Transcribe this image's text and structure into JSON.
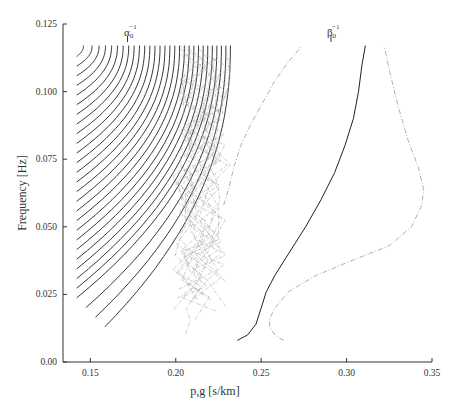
{
  "chart_data": {
    "type": "line",
    "title": "",
    "xlabel": "p,g [s/km]",
    "ylabel": "Frequency [Hz]",
    "xlim": [
      0.134,
      0.35
    ],
    "ylim": [
      0.0,
      0.125
    ],
    "grid": false,
    "legend": null,
    "x_ticks": [
      {
        "value": 0.15,
        "label": "0.15"
      },
      {
        "value": 0.2,
        "label": "0.20"
      },
      {
        "value": 0.25,
        "label": "0.25"
      },
      {
        "value": 0.3,
        "label": "0.30"
      },
      {
        "value": 0.35,
        "label": "0.35"
      }
    ],
    "y_ticks": [
      {
        "value": 0.0,
        "label": "0.00"
      },
      {
        "value": 0.025,
        "label": "0.025"
      },
      {
        "value": 0.05,
        "label": "0.050"
      },
      {
        "value": 0.075,
        "label": "0.075"
      },
      {
        "value": 0.1,
        "label": "0.100"
      },
      {
        "value": 0.125,
        "label": "0.125"
      }
    ],
    "annotations": [
      {
        "name": "alpha0-inverse",
        "base": "α",
        "sub": "0",
        "sup": "−1",
        "x": 0.169,
        "description": "P-wave slowness marker"
      },
      {
        "name": "beta0-inverse",
        "base": "β",
        "sub": "0",
        "sup": "−1",
        "x": 0.287,
        "description": "S-wave slowness marker"
      }
    ],
    "series": [
      {
        "name": "phase-slowness-fundamental-S",
        "style": "solid",
        "color": "#222222",
        "points": [
          [
            0.236,
            0.008
          ],
          [
            0.242,
            0.01
          ],
          [
            0.247,
            0.014
          ],
          [
            0.25,
            0.02
          ],
          [
            0.253,
            0.026
          ],
          [
            0.258,
            0.032
          ],
          [
            0.266,
            0.04
          ],
          [
            0.276,
            0.05
          ],
          [
            0.285,
            0.06
          ],
          [
            0.293,
            0.07
          ],
          [
            0.299,
            0.08
          ],
          [
            0.304,
            0.09
          ],
          [
            0.307,
            0.1
          ],
          [
            0.309,
            0.11
          ],
          [
            0.311,
            0.117
          ]
        ]
      },
      {
        "name": "group-slowness-fundamental-S",
        "style": "dashdot",
        "color": "#999999",
        "points": [
          [
            0.263,
            0.008
          ],
          [
            0.258,
            0.01
          ],
          [
            0.255,
            0.013
          ],
          [
            0.255,
            0.016
          ],
          [
            0.258,
            0.02
          ],
          [
            0.266,
            0.026
          ],
          [
            0.282,
            0.032
          ],
          [
            0.305,
            0.038
          ],
          [
            0.325,
            0.043
          ],
          [
            0.338,
            0.05
          ],
          [
            0.344,
            0.058
          ],
          [
            0.345,
            0.064
          ],
          [
            0.342,
            0.072
          ],
          [
            0.336,
            0.082
          ],
          [
            0.33,
            0.095
          ],
          [
            0.325,
            0.108
          ],
          [
            0.322,
            0.117
          ]
        ]
      },
      {
        "name": "group-slowness-left-S",
        "style": "dashdot",
        "color": "#999999",
        "points": [
          [
            0.228,
            0.058
          ],
          [
            0.231,
            0.064
          ],
          [
            0.234,
            0.072
          ],
          [
            0.238,
            0.08
          ],
          [
            0.244,
            0.088
          ],
          [
            0.251,
            0.096
          ],
          [
            0.258,
            0.104
          ],
          [
            0.266,
            0.111
          ],
          [
            0.274,
            0.117
          ]
        ]
      },
      {
        "name": "phase-slowness-modes",
        "style": "solid",
        "color": "#222222",
        "description": "Family of ~29 higher-mode phase slowness curves converging near 0.22–0.23 s/km at high frequency",
        "count": 29
      }
    ]
  },
  "alpha_label": {
    "base": "α",
    "sub": "0",
    "sup": "−1"
  },
  "beta_label": {
    "base": "β",
    "sub": "0",
    "sup": "−1"
  }
}
